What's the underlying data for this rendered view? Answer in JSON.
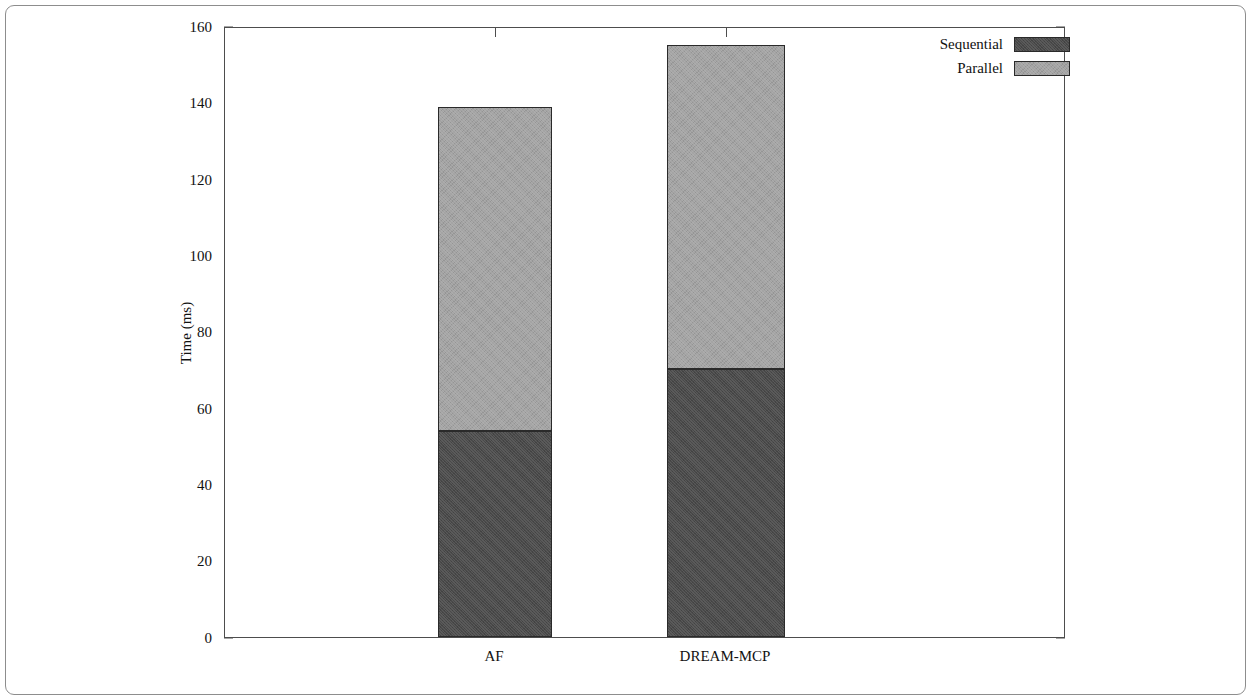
{
  "chart_data": {
    "type": "bar",
    "subtype": "stacked",
    "title": "",
    "xlabel": "",
    "ylabel": "Time (ms)",
    "ylim": [
      0,
      160
    ],
    "yticks": [
      0,
      20,
      40,
      60,
      80,
      100,
      120,
      140,
      160
    ],
    "ytick_labels": [
      "0",
      "20",
      "40",
      "60",
      "80",
      "100",
      "120",
      "140",
      "160"
    ],
    "grid": false,
    "legend_position": "top-right",
    "categories": [
      "AF",
      "DREAM-MCP"
    ],
    "series": [
      {
        "name": "Sequential",
        "color": "#4a4a4a",
        "values": [
          54.2,
          70.3
        ]
      },
      {
        "name": "Parallel",
        "color": "#a3a3a3",
        "values": [
          85.0,
          85.2
        ]
      }
    ],
    "totals": [
      139.2,
      155.5
    ]
  },
  "axis": {
    "ylabel": "Time (ms)",
    "ytick_labels": {
      "t0": "0",
      "t20": "20",
      "t40": "40",
      "t60": "60",
      "t80": "80",
      "t100": "100",
      "t120": "120",
      "t140": "140",
      "t160": "160"
    },
    "xtick_labels": {
      "c0": "AF",
      "c1": "DREAM-MCP"
    }
  },
  "legend": {
    "entries": [
      {
        "label": "Sequential",
        "color": "#4a4a4a"
      },
      {
        "label": "Parallel",
        "color": "#a3a3a3"
      }
    ]
  },
  "colors": {
    "sequential": "#4a4a4a",
    "parallel": "#a3a3a3",
    "axis": "#4d4d4d",
    "frame": "#8d8d8d",
    "background": "#ffffff"
  }
}
